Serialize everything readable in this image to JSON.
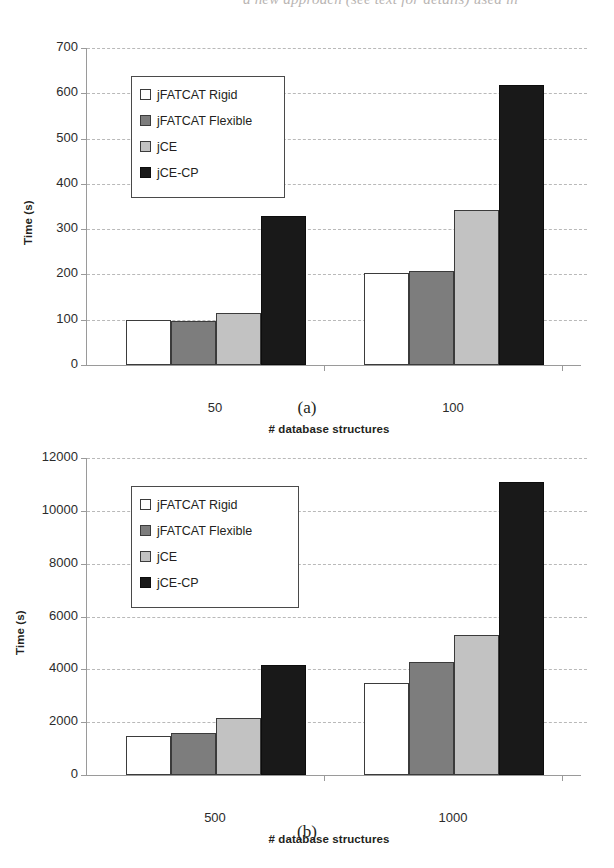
{
  "page": {
    "top_running_text": "a new approach (see text for details) used in",
    "caption_a": "(a)",
    "caption_b": "(b)"
  },
  "legend": {
    "items": [
      {
        "label": "jFATCAT Rigid",
        "color": "#ffffff",
        "swatch": "b0"
      },
      {
        "label": "jFATCAT Flexible",
        "color": "#7d7d7d",
        "swatch": "b1"
      },
      {
        "label": "jCE",
        "color": "#c2c2c2",
        "swatch": "b2"
      },
      {
        "label": "jCE-CP",
        "color": "#191919",
        "swatch": "b3"
      }
    ]
  },
  "chart_data": [
    {
      "id": "chart-a",
      "type": "bar",
      "title": "",
      "xlabel": "# database structures",
      "ylabel": "Time (s)",
      "categories": [
        "50",
        "100"
      ],
      "ylim": [
        0,
        700
      ],
      "yticks": [
        0,
        100,
        200,
        300,
        400,
        500,
        600,
        700
      ],
      "ytick_labels": [
        "0",
        "100",
        "200",
        "300",
        "400",
        "500",
        "600",
        "700"
      ],
      "grid": true,
      "legend_position": "upper-left",
      "series": [
        {
          "name": "jFATCAT Rigid",
          "values": [
            100,
            203
          ]
        },
        {
          "name": "jFATCAT Flexible",
          "values": [
            98,
            208
          ]
        },
        {
          "name": "jCE",
          "values": [
            115,
            343
          ]
        },
        {
          "name": "jCE-CP",
          "values": [
            330,
            618
          ]
        }
      ]
    },
    {
      "id": "chart-b",
      "type": "bar",
      "title": "",
      "xlabel": "# database structures",
      "ylabel": "Time (s)",
      "categories": [
        "500",
        "1000"
      ],
      "ylim": [
        0,
        12000
      ],
      "yticks": [
        0,
        2000,
        4000,
        6000,
        8000,
        10000,
        12000
      ],
      "ytick_labels": [
        "0",
        "2000",
        "4000",
        "6000",
        "8000",
        "10000",
        "12000"
      ],
      "grid": true,
      "legend_position": "upper-left",
      "series": [
        {
          "name": "jFATCAT Rigid",
          "values": [
            1470,
            3480
          ]
        },
        {
          "name": "jFATCAT Flexible",
          "values": [
            1600,
            4280
          ]
        },
        {
          "name": "jCE",
          "values": [
            2150,
            5300
          ]
        },
        {
          "name": "jCE-CP",
          "values": [
            4170,
            11100
          ]
        }
      ]
    }
  ]
}
